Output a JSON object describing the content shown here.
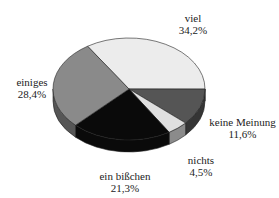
{
  "chart_data": {
    "type": "pie",
    "style": "3d",
    "title": "",
    "slices": [
      {
        "label": "viel",
        "value": 34.2,
        "value_text": "34,2%",
        "color": "#ececec"
      },
      {
        "label": "keine Meinung",
        "value": 11.6,
        "value_text": "11,6%",
        "color": "#555555"
      },
      {
        "label": "nichts",
        "value": 4.5,
        "value_text": "4,5%",
        "color": "#e0e0e0"
      },
      {
        "label": "ein bißchen",
        "value": 21.3,
        "value_text": "21,3%",
        "color": "#0a0a0a"
      },
      {
        "label": "einiges",
        "value": 28.4,
        "value_text": "28,4%",
        "color": "#8a8a8a"
      }
    ]
  }
}
